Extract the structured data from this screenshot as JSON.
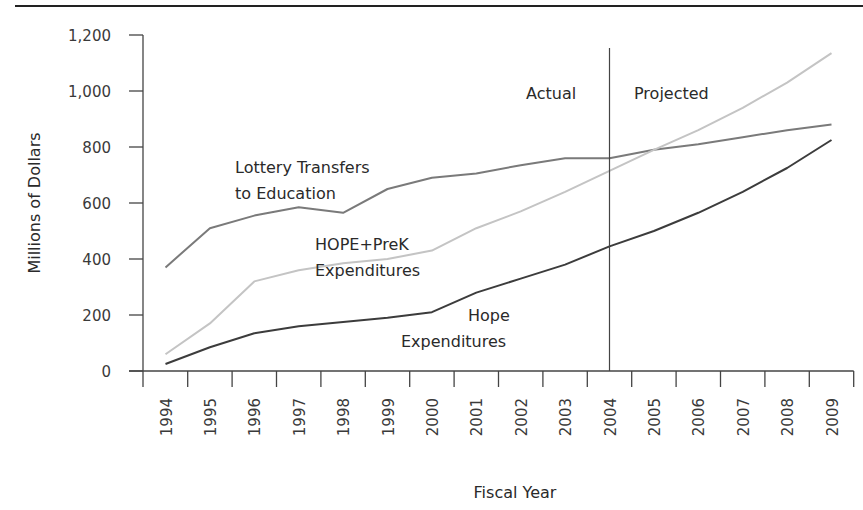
{
  "chart_data": {
    "type": "line",
    "title": "",
    "xlabel": "Fiscal Year",
    "ylabel": "Millions of Dollars",
    "ylim": [
      0,
      1200
    ],
    "yticks": [
      0,
      200,
      400,
      600,
      800,
      1000,
      1200
    ],
    "ytick_labels": [
      "0",
      "200",
      "400",
      "600",
      "800",
      "1,000",
      "1,200"
    ],
    "grid": false,
    "categories": [
      "1994",
      "1995",
      "1996",
      "1997",
      "1998",
      "1999",
      "2000",
      "2001",
      "2002",
      "2003",
      "2004",
      "2005",
      "2006",
      "2007",
      "2008",
      "2009"
    ],
    "series": [
      {
        "name": "Lottery Transfers to Education",
        "label_lines": [
          "Lottery Transfers",
          "to Education"
        ],
        "color": "#7a7a7a",
        "values": [
          370,
          510,
          555,
          585,
          565,
          650,
          690,
          705,
          735,
          760,
          760,
          790,
          810,
          835,
          860,
          880
        ]
      },
      {
        "name": "HOPE+PreK Expenditures",
        "label_lines": [
          "HOPE+PreK",
          "Expenditures"
        ],
        "color": "#c4c4c4",
        "values": [
          60,
          170,
          320,
          360,
          385,
          400,
          430,
          510,
          570,
          640,
          715,
          790,
          860,
          940,
          1030,
          1135
        ]
      },
      {
        "name": "Hope Expenditures",
        "label_lines": [
          "Hope",
          "Expenditures"
        ],
        "color": "#3c3c3c",
        "values": [
          25,
          85,
          135,
          160,
          175,
          190,
          210,
          280,
          330,
          380,
          445,
          500,
          565,
          640,
          725,
          825
        ]
      }
    ],
    "annotations": [
      {
        "text": "Actual",
        "side": "left of 2004 divider"
      },
      {
        "text": "Projected",
        "side": "right of 2004 divider"
      }
    ],
    "divider_year": "2004"
  }
}
